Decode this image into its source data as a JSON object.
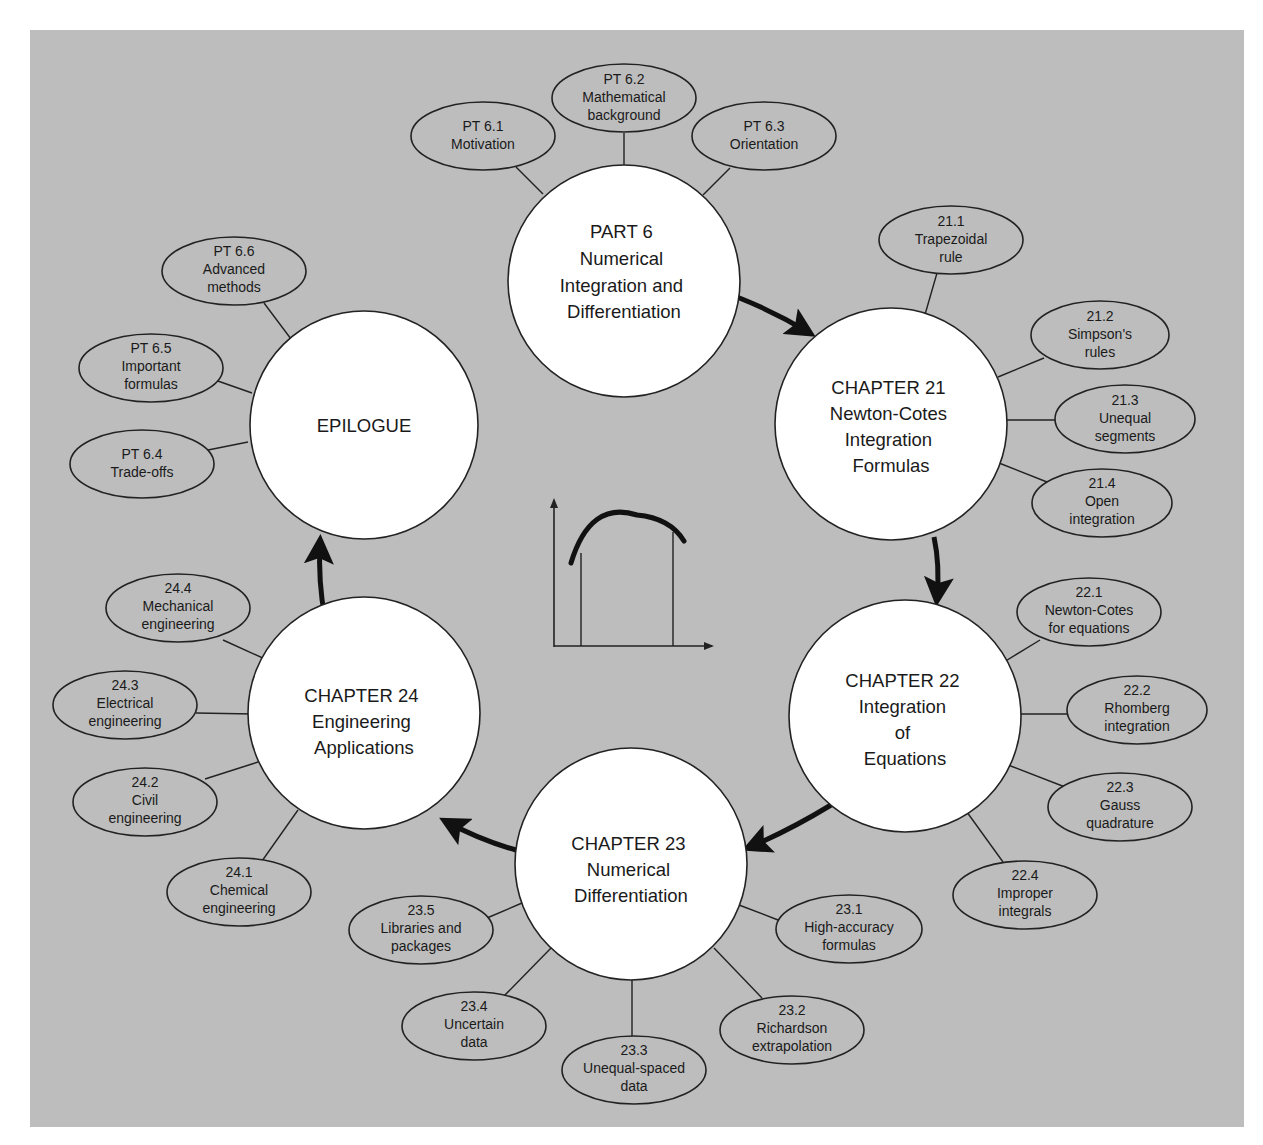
{
  "diagram": {
    "background_color": "#bdbdbd",
    "main_nodes": [
      {
        "id": "part6",
        "lines": [
          "PART 6",
          "Numerical",
          "Integration and",
          "Differentiation"
        ]
      },
      {
        "id": "ch21",
        "lines": [
          "CHAPTER 21",
          "Newton-Cotes",
          "Integration",
          "Formulas"
        ]
      },
      {
        "id": "ch22",
        "lines": [
          "CHAPTER 22",
          "Integration",
          "of",
          "Equations"
        ]
      },
      {
        "id": "ch23",
        "lines": [
          "CHAPTER 23",
          "Numerical",
          "Differentiation"
        ]
      },
      {
        "id": "ch24",
        "lines": [
          "CHAPTER 24",
          "Engineering",
          "Applications"
        ]
      },
      {
        "id": "epilogue",
        "lines": [
          "EPILOGUE"
        ]
      }
    ],
    "sub_nodes": {
      "part6": [
        {
          "num": "PT 6.1",
          "lines": [
            "Motivation"
          ]
        },
        {
          "num": "PT 6.2",
          "lines": [
            "Mathematical",
            "background"
          ]
        },
        {
          "num": "PT 6.3",
          "lines": [
            "Orientation"
          ]
        }
      ],
      "ch21": [
        {
          "num": "21.1",
          "lines": [
            "Trapezoidal",
            "rule"
          ]
        },
        {
          "num": "21.2",
          "lines": [
            "Simpson's",
            "rules"
          ]
        },
        {
          "num": "21.3",
          "lines": [
            "Unequal",
            "segments"
          ]
        },
        {
          "num": "21.4",
          "lines": [
            "Open",
            "integration"
          ]
        }
      ],
      "ch22": [
        {
          "num": "22.1",
          "lines": [
            "Newton-Cotes",
            "for equations"
          ]
        },
        {
          "num": "22.2",
          "lines": [
            "Rhomberg",
            "integration"
          ]
        },
        {
          "num": "22.3",
          "lines": [
            "Gauss",
            "quadrature"
          ]
        },
        {
          "num": "22.4",
          "lines": [
            "Improper",
            "integrals"
          ]
        }
      ],
      "ch23": [
        {
          "num": "23.1",
          "lines": [
            "High-accuracy",
            "formulas"
          ]
        },
        {
          "num": "23.2",
          "lines": [
            "Richardson",
            "extrapolation"
          ]
        },
        {
          "num": "23.3",
          "lines": [
            "Unequal-spaced",
            "data"
          ]
        },
        {
          "num": "23.4",
          "lines": [
            "Uncertain",
            "data"
          ]
        },
        {
          "num": "23.5",
          "lines": [
            "Libraries and",
            "packages"
          ]
        }
      ],
      "ch24": [
        {
          "num": "24.1",
          "lines": [
            "Chemical",
            "engineering"
          ]
        },
        {
          "num": "24.2",
          "lines": [
            "Civil",
            "engineering"
          ]
        },
        {
          "num": "24.3",
          "lines": [
            "Electrical",
            "engineering"
          ]
        },
        {
          "num": "24.4",
          "lines": [
            "Mechanical",
            "engineering"
          ]
        }
      ],
      "epilogue": [
        {
          "num": "PT 6.4",
          "lines": [
            "Trade-offs"
          ]
        },
        {
          "num": "PT 6.5",
          "lines": [
            "Important",
            "formulas"
          ]
        },
        {
          "num": "PT 6.6",
          "lines": [
            "Advanced",
            "methods"
          ]
        }
      ]
    },
    "flow_order": [
      "part6",
      "ch21",
      "ch22",
      "ch23",
      "ch24",
      "epilogue"
    ],
    "center_icon": "integral-area-under-curve-icon"
  }
}
